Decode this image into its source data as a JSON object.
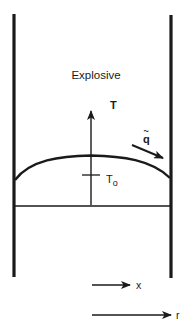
{
  "diagram": {
    "region_label": "Explosive",
    "vertical_axis_label": "T",
    "reference_temperature_label": "T",
    "reference_temperature_subscript": "o",
    "heat_flux_label": "q",
    "heat_flux_accent": "~",
    "axial_coordinate_label": "x",
    "radial_coordinate_label": "r",
    "colors": {
      "ink": "#1a1a1a",
      "background": "#ffffff"
    }
  }
}
